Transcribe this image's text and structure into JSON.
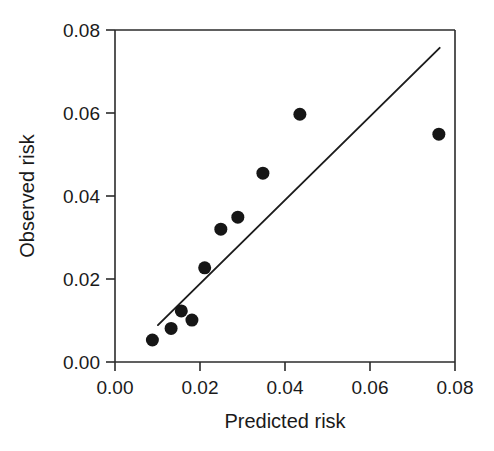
{
  "figure": {
    "background_color": "#ffffff",
    "marker_color": "#161616",
    "line_color": "#1c1c1c",
    "axis_color": "#2b2b2b"
  },
  "chart_data": {
    "type": "scatter",
    "title": "",
    "xlabel": "Predicted risk",
    "ylabel": "Observed risk",
    "xlim": [
      0.0,
      0.08
    ],
    "ylim": [
      0.0,
      0.08
    ],
    "xticks": [
      0.0,
      0.02,
      0.04,
      0.06,
      0.08
    ],
    "yticks": [
      0.0,
      0.02,
      0.04,
      0.06,
      0.08
    ],
    "xticklabels": [
      "0.00",
      "0.02",
      "0.04",
      "0.06",
      "0.08"
    ],
    "yticklabels": [
      "0.00",
      "0.02",
      "0.04",
      "0.06",
      "0.08"
    ],
    "grid": false,
    "legend": false,
    "series": [
      {
        "name": "Risk deciles",
        "type": "scatter",
        "marker": "filled-circle",
        "marker_size_px": 13,
        "color": "#161616",
        "x": [
          0.0088,
          0.0132,
          0.0156,
          0.0181,
          0.0211,
          0.0249,
          0.0289,
          0.0348,
          0.0435,
          0.0762
        ],
        "y": [
          0.0053,
          0.0081,
          0.0123,
          0.0101,
          0.0227,
          0.032,
          0.0349,
          0.0455,
          0.0597,
          0.0549
        ]
      },
      {
        "name": "Reference line",
        "type": "line",
        "color": "#1c1c1c",
        "x": [
          0.0101,
          0.0764
        ],
        "y": [
          0.0089,
          0.0757
        ]
      }
    ]
  }
}
